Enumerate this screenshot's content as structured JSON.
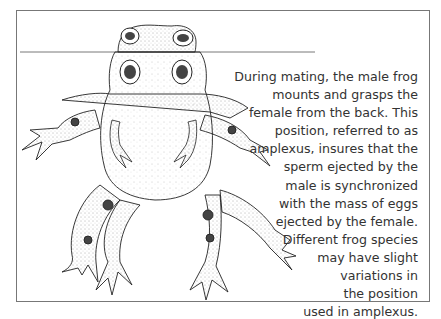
{
  "figure": {
    "caption_lines": [
      "During mating, the male frog",
      "mounts and grasps the",
      "female from the back. This",
      "position, referred to as",
      "amplexus, insures that the",
      "sperm ejected by the",
      "male is synchronized",
      "with the mass of eggs",
      "ejected by the female.",
      "Different frog species",
      "may have slight",
      "variations in",
      "the position",
      "used in amplexus."
    ]
  }
}
